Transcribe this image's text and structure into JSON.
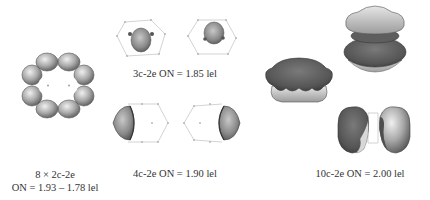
{
  "figure": {
    "panels": [
      {
        "id": "ring",
        "title": "8 × 2c-2e",
        "caption": "ON = 1.93 – 1.78 lel",
        "lobe_count": 8
      },
      {
        "id": "three-center",
        "caption": "3c-2e ON = 1.85 lel",
        "views": 2
      },
      {
        "id": "four-center",
        "caption": "4c-2e ON = 1.90 lel",
        "views": 2
      },
      {
        "id": "ten-center",
        "caption": "10c-2e ON = 2.00 lel",
        "views": 3
      }
    ],
    "colors": {
      "background": "#ffffff",
      "lobe_light": "#d8d8d8",
      "lobe_mid": "#9a9a9a",
      "lobe_dark": "#5a5a5a",
      "lobe_darkest": "#3e3e3e",
      "wireframe": "#c8c8c8",
      "text": "#333333"
    }
  }
}
